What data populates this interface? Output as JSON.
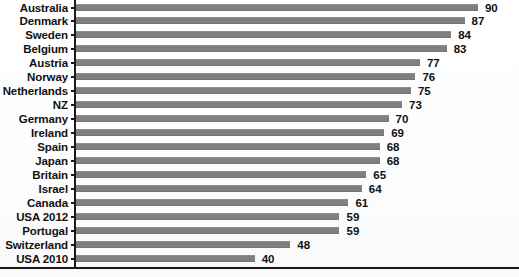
{
  "chart_data": {
    "type": "bar",
    "orientation": "horizontal",
    "title": "",
    "subtitle": "",
    "xlabel": "",
    "ylabel": "",
    "xlim": [
      0,
      90
    ],
    "grid": false,
    "legend": null,
    "bar_color": "#808080",
    "axis_color": "#1a1a1a",
    "label_color": "#111111",
    "categories": [
      "Australia",
      "Denmark",
      "Sweden",
      "Belgium",
      "Austria",
      "Norway",
      "Netherlands",
      "NZ",
      "Germany",
      "Ireland",
      "Spain",
      "Japan",
      "Britain",
      "Israel",
      "Canada",
      "USA 2012",
      "Portugal",
      "Switzerland",
      "USA 2010"
    ],
    "values": [
      90,
      87,
      84,
      83,
      77,
      76,
      75,
      73,
      70,
      69,
      68,
      68,
      65,
      64,
      61,
      59,
      59,
      48,
      40
    ],
    "data_labels": [
      "90",
      "87",
      "84",
      "83",
      "77",
      "76",
      "75",
      "73",
      "70",
      "69",
      "68",
      "68",
      "65",
      "64",
      "61",
      "59",
      "59",
      "48",
      "40"
    ]
  }
}
